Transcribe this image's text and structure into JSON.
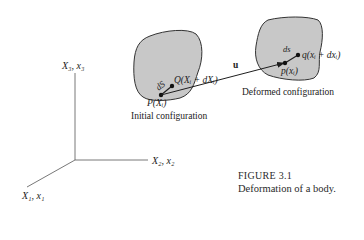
{
  "figure": {
    "number_label": "FIGURE 3.1",
    "caption": "Deformation of a body."
  },
  "axes": {
    "x3_label": "X₃, x₃",
    "x2_label": "X₂, x₂",
    "x1_label": "X₁, x₁"
  },
  "initial": {
    "label": "Initial configuration",
    "point_P": "P(Xᵢ)",
    "point_Q": "Q(Xᵢ + dXᵢ)",
    "segment": "dS"
  },
  "deformed": {
    "label": "Deformed configuration",
    "point_p": "p(xᵢ)",
    "point_q": "q(xᵢ + dxᵢ)",
    "segment": "ds"
  },
  "displacement": {
    "label": "u"
  },
  "colors": {
    "blob_fill": "#c8c8c8",
    "ink": "#1e1e1e"
  }
}
